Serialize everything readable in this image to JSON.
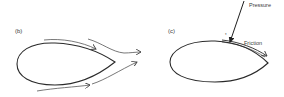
{
  "panels": [
    {
      "id": "b",
      "label": "(b)",
      "description": "streamlined body with flow lines passing around it"
    },
    {
      "id": "c",
      "label": "(c)",
      "description": "streamlined body with pressure and friction forces on surface",
      "annotations": {
        "pressure": "Pressure",
        "friction": "Friction",
        "tau": "τ"
      }
    }
  ],
  "colors": {
    "stroke": "#2a2a2a",
    "flow": "#555555",
    "text": "#3a3a3a",
    "background": "#ffffff"
  }
}
